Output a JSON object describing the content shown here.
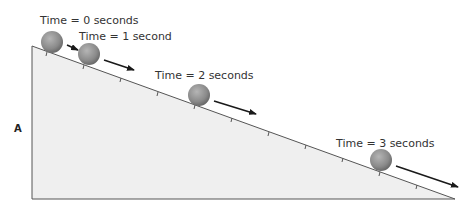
{
  "diagram": {
    "point_label": "A",
    "labels": [
      {
        "text": "Time = 0 seconds",
        "x": 38,
        "y": 23
      },
      {
        "text": "Time = 1 second",
        "x": 78,
        "y": 40
      },
      {
        "text": "Time = 2 seconds",
        "x": 154,
        "y": 79
      },
      {
        "text": "Time = 3 seconds",
        "x": 336,
        "y": 147
      }
    ],
    "balls": [
      {
        "cx": 52,
        "cy": 42,
        "r": 11
      },
      {
        "cx": 89,
        "cy": 54,
        "r": 11
      },
      {
        "cx": 199,
        "cy": 95,
        "r": 11
      },
      {
        "cx": 381,
        "cy": 160,
        "r": 11
      }
    ],
    "arrows": [
      {
        "x1": 66,
        "y1": 45,
        "x2": 76,
        "y2": 50
      },
      {
        "x1": 104,
        "y1": 60,
        "x2": 133,
        "y2": 70
      },
      {
        "x1": 214,
        "y1": 100,
        "x2": 255,
        "y2": 113
      },
      {
        "x1": 396,
        "y1": 166,
        "x2": 458,
        "y2": 186
      }
    ],
    "colors": {
      "incline_fill": "#efefef",
      "incline_stroke": "#444444",
      "ball": "#8a8a8a",
      "arrow": "#1a1a1a"
    }
  }
}
